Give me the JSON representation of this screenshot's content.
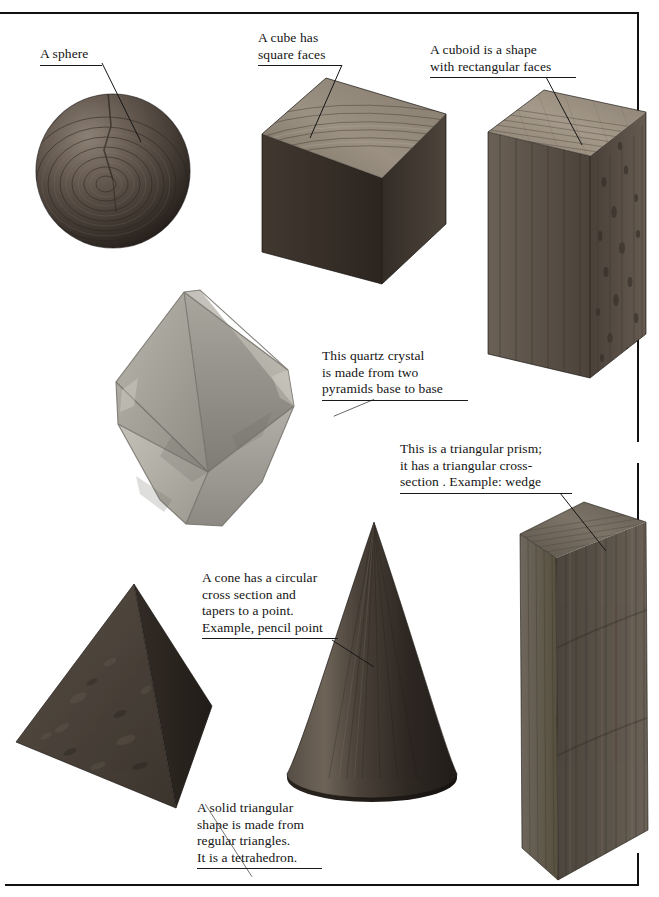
{
  "page": {
    "background_color": "#ffffff",
    "rule_color": "#111111"
  },
  "annotations": [
    {
      "id": "sphere",
      "text": "A sphere",
      "x": 40,
      "y": 46,
      "width": 62,
      "leader": {
        "x1": 62,
        "y1": 17,
        "x2": 101,
        "y2": 96
      }
    },
    {
      "id": "cube",
      "text": "A cube has\nsquare faces",
      "x": 258,
      "y": 30,
      "width": 84,
      "leader": {
        "x1": 84,
        "y1": 35,
        "x2": 52,
        "y2": 108
      }
    },
    {
      "id": "cuboid",
      "text": "A cuboid is a shape\nwith rectangular faces",
      "x": 430,
      "y": 42,
      "width": 146,
      "leader": {
        "x1": 116,
        "y1": 35,
        "x2": 152,
        "y2": 103
      }
    },
    {
      "id": "quartz",
      "text": "This quartz crystal\nis made from two\npyramids base to base",
      "x": 322,
      "y": 348,
      "width": 146,
      "leader": {
        "x1": 0,
        "y1": 52,
        "x2": -62,
        "y2": 78
      }
    },
    {
      "id": "prism",
      "text": "This is a triangular prism;\nit has a triangular cross-\nsection . Example: wedge",
      "x": 400,
      "y": 441,
      "width": 172,
      "leader": {
        "x1": 160,
        "y1": 52,
        "x2": 206,
        "y2": 110
      }
    },
    {
      "id": "cone",
      "text": "A cone has a circular\ncross section and\ntapers to a point.\nExample, pencil point",
      "x": 202,
      "y": 570,
      "width": 136,
      "leader": {
        "x1": 130,
        "y1": 70,
        "x2": 172,
        "y2": 97
      }
    },
    {
      "id": "tetrahedron",
      "text": "A solid triangular\nshape is made from\nregular triangles.\nIt is a tetrahedron.",
      "x": 197,
      "y": 800,
      "width": 125,
      "leader": {
        "x1": 0,
        "y1": 68,
        "x2": -78,
        "y2": -53
      }
    }
  ],
  "shapes": [
    {
      "id": "sphere",
      "name": "wooden-sphere",
      "label": "A sphere"
    },
    {
      "id": "cube",
      "name": "wooden-cube",
      "label": "A cube has square faces"
    },
    {
      "id": "cuboid",
      "name": "wooden-cuboid",
      "label": "A cuboid is a shape with rectangular faces"
    },
    {
      "id": "quartz",
      "name": "quartz-crystal-octahedron",
      "label": "This quartz crystal is made from two pyramids base to base"
    },
    {
      "id": "prism",
      "name": "wooden-triangular-prism",
      "label": "This is a triangular prism"
    },
    {
      "id": "cone",
      "name": "wooden-cone",
      "label": "A cone has a circular cross section"
    },
    {
      "id": "tetrahedron",
      "name": "wooden-tetrahedron",
      "label": "A solid triangular shape is a tetrahedron"
    }
  ],
  "colors": {
    "ink": "#141414",
    "wood_dark": "#4a4038",
    "wood_darker": "#2e2823",
    "wood_mid": "#6f6258",
    "wood_light": "#9a8d80",
    "wood_top": "#8d8275",
    "crystal_light": "#c9c6bf",
    "crystal_mid": "#a7a49c",
    "crystal_dark": "#8b8880",
    "prism_face": "#585048",
    "prism_side": "#6d655c",
    "cone_dark": "#3e362f",
    "cone_light": "#7b7067"
  },
  "rules": [
    {
      "id": "top-rule",
      "x": 0,
      "y": 12,
      "w": 639,
      "h": 2
    },
    {
      "id": "right-rule-a",
      "x": 637,
      "y": 12,
      "w": 2,
      "h": 100
    },
    {
      "id": "right-rule-b",
      "x": 637,
      "y": 227,
      "w": 2,
      "h": 215
    },
    {
      "id": "right-rule-c",
      "x": 637,
      "y": 463,
      "w": 2,
      "h": 60
    },
    {
      "id": "right-rule-d",
      "x": 637,
      "y": 853,
      "w": 2,
      "h": 32
    },
    {
      "id": "bottom-rule",
      "x": 5,
      "y": 884,
      "w": 634,
      "h": 2
    }
  ]
}
